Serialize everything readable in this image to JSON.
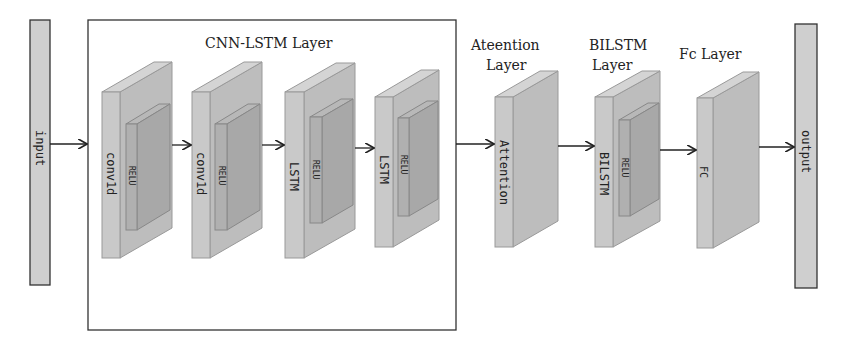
{
  "diagram": {
    "input_label": "input",
    "output_label": "output",
    "groups": {
      "cnn_lstm": "CNN-LSTM Layer",
      "attention_l1": "Ateention",
      "attention_l2": "Layer",
      "bilstm_l1": "BILSTM",
      "bilstm_l2": "Layer",
      "fc": "Fc Layer"
    },
    "blocks": [
      {
        "label": "conv1d",
        "inner": "RELU"
      },
      {
        "label": "conv1d",
        "inner": "RELU"
      },
      {
        "label": "LSTM",
        "inner": "RELU"
      },
      {
        "label": "LSTM",
        "inner": "RELU"
      },
      {
        "label": "Attention",
        "inner": ""
      },
      {
        "label": "BILSTM",
        "inner": "RELU"
      },
      {
        "label": "FC",
        "inner": ""
      }
    ],
    "colors": {
      "face": "#c8c8c8",
      "side": "#b4b4b4",
      "top": "#d2d2d2",
      "inner_face": "#a9a9a9",
      "inner_side": "#9e9e9e",
      "stroke": "#888888",
      "line": "#222222"
    }
  }
}
